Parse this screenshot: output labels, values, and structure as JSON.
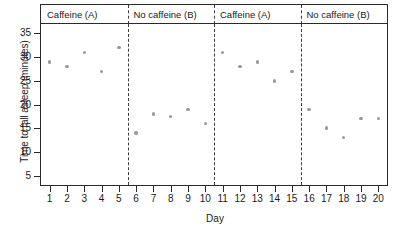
{
  "chart_data": {
    "type": "scatter",
    "title": "",
    "xlabel": "Day",
    "ylabel": "Time to fall asleep (minutes)",
    "xlim": [
      0.5,
      20.5
    ],
    "ylim": [
      3,
      37
    ],
    "grid": false,
    "legend_position": "none",
    "x": [
      1,
      2,
      3,
      4,
      5,
      6,
      7,
      8,
      9,
      10,
      11,
      12,
      13,
      14,
      15,
      16,
      17,
      18,
      19,
      20
    ],
    "values": [
      29,
      28,
      31,
      27,
      32,
      14,
      18,
      17.5,
      19,
      16,
      31,
      28,
      29,
      25,
      27,
      19,
      15,
      13,
      17,
      17
    ],
    "ytick_labels": [
      "5",
      "10",
      "15",
      "20",
      "25",
      "30",
      "35"
    ],
    "yticks": [
      5,
      10,
      15,
      20,
      25,
      30,
      35
    ],
    "xtick_labels": [
      "1",
      "2",
      "3",
      "4",
      "5",
      "6",
      "7",
      "8",
      "9",
      "10",
      "11",
      "12",
      "13",
      "14",
      "15",
      "16",
      "17",
      "18",
      "19",
      "20"
    ],
    "xticks": [
      1,
      2,
      3,
      4,
      5,
      6,
      7,
      8,
      9,
      10,
      11,
      12,
      13,
      14,
      15,
      16,
      17,
      18,
      19,
      20
    ],
    "point_color": "#9a9a9a",
    "axis_color": "#2a2a2a",
    "divider_color": "#3c3c3c",
    "dividers": [
      5.5,
      10.5,
      15.5
    ],
    "panels": [
      {
        "label": "Caffeine (A)",
        "start": 0.5,
        "end": 5.5
      },
      {
        "label": "No caffeine (B)",
        "start": 5.5,
        "end": 10.5
      },
      {
        "label": "Caffeine (A)",
        "start": 10.5,
        "end": 15.5
      },
      {
        "label": "No caffeine (B)",
        "start": 15.5,
        "end": 20.5
      }
    ]
  }
}
